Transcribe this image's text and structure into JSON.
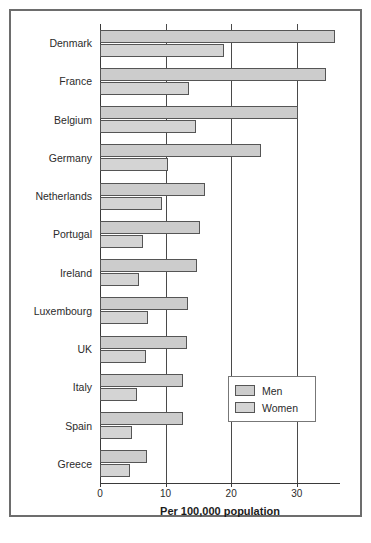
{
  "chart_data": {
    "type": "bar",
    "orientation": "horizontal",
    "title": "",
    "xlabel": "Per 100,000 population",
    "ylabel": "",
    "xlim": [
      0,
      36.6
    ],
    "xticks": [
      0,
      10,
      20,
      30
    ],
    "xtick_labels": [
      "0",
      "10",
      "20",
      "30"
    ],
    "grid": true,
    "grid_axis": "x",
    "legend_position": "center-right",
    "categories": [
      "Denmark",
      "France",
      "Belgium",
      "Germany",
      "Netherlands",
      "Portugal",
      "Ireland",
      "Luxembourg",
      "UK",
      "Italy",
      "Spain",
      "Greece"
    ],
    "series": [
      {
        "name": "Men",
        "color": "#cccccc",
        "values": [
          35.8,
          34.5,
          30.2,
          24.5,
          16.0,
          15.3,
          14.8,
          13.4,
          13.3,
          12.7,
          12.7,
          7.2
        ]
      },
      {
        "name": "Women",
        "color": "#d4d4d4",
        "values": [
          18.9,
          13.5,
          14.6,
          10.4,
          9.5,
          6.6,
          5.9,
          7.3,
          7.0,
          5.6,
          4.9,
          4.6
        ]
      }
    ]
  },
  "legend": {
    "items": [
      {
        "label": "Men"
      },
      {
        "label": "Women"
      }
    ]
  },
  "colors": {
    "men_bar": "#cccccc",
    "women_bar": "#d4d4d4",
    "bar_outline": "#555555",
    "axis": "#3a3a3a",
    "gridline": "#4a4a4a",
    "frame": "#6d6d6d",
    "text": "#2b2b2b",
    "background": "#ffffff"
  }
}
